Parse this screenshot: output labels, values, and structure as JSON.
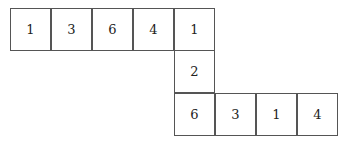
{
  "diagram": {
    "cells": [
      {
        "value": "1",
        "row": 0,
        "col": 0
      },
      {
        "value": "3",
        "row": 0,
        "col": 1
      },
      {
        "value": "6",
        "row": 0,
        "col": 2
      },
      {
        "value": "4",
        "row": 0,
        "col": 3
      },
      {
        "value": "1",
        "row": 0,
        "col": 4
      },
      {
        "value": "2",
        "row": 1,
        "col": 4
      },
      {
        "value": "6",
        "row": 2,
        "col": 4
      },
      {
        "value": "3",
        "row": 2,
        "col": 5
      },
      {
        "value": "1",
        "row": 2,
        "col": 6
      },
      {
        "value": "4",
        "row": 2,
        "col": 7
      }
    ]
  }
}
